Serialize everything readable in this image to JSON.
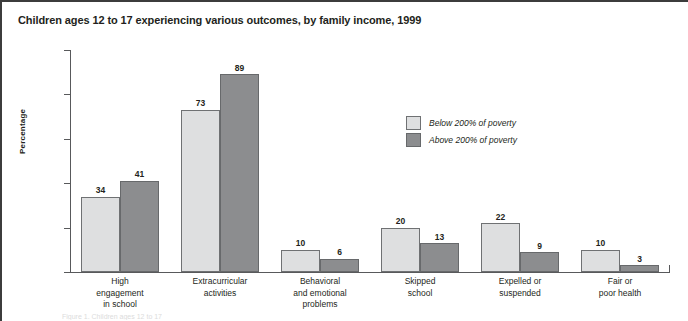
{
  "figure": {
    "title": "Children ages 12 to 17 experiencing various outcomes, by family income, 1999",
    "ylabel": "Percentage",
    "footnote_partial": "Figure 1. Children ages 12 to 17"
  },
  "legend": {
    "position": "center-right",
    "entries": [
      {
        "label": "Below 200% of poverty",
        "color": "#dedfe0",
        "swatch": "below"
      },
      {
        "label": "Above 200% of poverty",
        "color": "#8c8d8f",
        "swatch": "above"
      }
    ]
  },
  "axis": {
    "y_ticks": [
      "0",
      "20",
      "40",
      "60",
      "80",
      "100"
    ],
    "y_min": 0,
    "y_max": 100
  },
  "chart_data": {
    "type": "bar",
    "title": "Children ages 12 to 17 experiencing various outcomes, by family income, 1999",
    "xlabel": "",
    "ylabel": "Percentage",
    "ylim": [
      0,
      100
    ],
    "yticks": [
      0,
      20,
      40,
      60,
      80,
      100
    ],
    "grid": false,
    "legend_position": "center-right",
    "categories": [
      "High engagement in school",
      "Extracurricular activities",
      "Behavioral and emotional problems",
      "Skipped school",
      "Expelled or suspended",
      "Fair or poor health"
    ],
    "category_labels_wrapped": [
      "High\nengagement\nin school",
      "Extracurricular\nactivities",
      "Behavioral\nand emotional\nproblems",
      "Skipped\nschool",
      "Expelled or\nsuspended",
      "Fair or\npoor health"
    ],
    "series": [
      {
        "name": "Below 200% of poverty",
        "color": "#dedfe0",
        "values": [
          34,
          73,
          10,
          20,
          22,
          10
        ]
      },
      {
        "name": "Above 200% of poverty",
        "color": "#8c8d8f",
        "values": [
          41,
          89,
          6,
          13,
          9,
          3
        ]
      }
    ]
  }
}
